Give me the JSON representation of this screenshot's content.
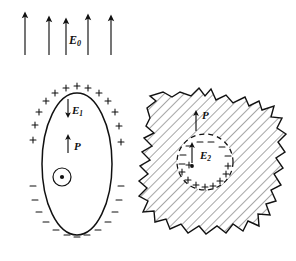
{
  "figure": {
    "background_color": "#ffffff",
    "ink_color": "#111111",
    "hatch_color": "#333333"
  },
  "applied_field": {
    "label": "E",
    "subscript": "0",
    "direction": "up",
    "arrow_count": 5,
    "arrows": [
      {
        "x": 25,
        "y_tail": 55,
        "y_head": 14
      },
      {
        "x": 49,
        "y_tail": 55,
        "y_head": 18
      },
      {
        "x": 66,
        "y_tail": 55,
        "y_head": 20
      },
      {
        "x": 88,
        "y_tail": 55,
        "y_head": 16
      },
      {
        "x": 111,
        "y_tail": 55,
        "y_head": 17
      }
    ],
    "label_x": 69,
    "label_y": 33
  },
  "left_figure": {
    "name": "polarized-dielectric-ellipsoid",
    "shape": "ellipse",
    "cx": 77,
    "cy": 164,
    "rx": 35,
    "ry": 71,
    "depolarization_field": {
      "label": "E",
      "subscript": "1",
      "direction": "down",
      "arrow_x": 68,
      "arrow_y_tail": 99,
      "arrow_y_head": 116
    },
    "polarization": {
      "label": "P",
      "direction": "up",
      "arrow_x": 68,
      "arrow_y_tail": 153,
      "arrow_y_head": 136
    },
    "out_of_page_symbol": {
      "name": "vector-out-of-page",
      "cx": 62,
      "cy": 177,
      "r": 9
    },
    "positive_charges_top": 13,
    "negative_charges_bottom": 13,
    "plus_symbol": "+",
    "minus_symbol": "−"
  },
  "right_figure": {
    "name": "spherical-cavity-in-dielectric",
    "shape": "irregular-hatched-blob",
    "hatched": true,
    "cavity": {
      "name": "spherical-cavity",
      "cx": 205,
      "cy": 162,
      "r": 28,
      "border_style": "dashed",
      "negative_charges_top": 7,
      "positive_charges_bottom": 9
    },
    "cavity_field": {
      "label": "E",
      "subscript": "2",
      "direction": "up",
      "arrow_x": 192,
      "arrow_y_tail": 163,
      "arrow_y_head": 144
    },
    "polarization": {
      "label": "P",
      "direction": "up",
      "arrow_x": 196,
      "arrow_y_tail": 131,
      "arrow_y_head": 112
    },
    "center_dot": {
      "cx": 192,
      "cy": 166,
      "r": 2
    },
    "plus_symbol": "+",
    "minus_symbol": "−"
  }
}
